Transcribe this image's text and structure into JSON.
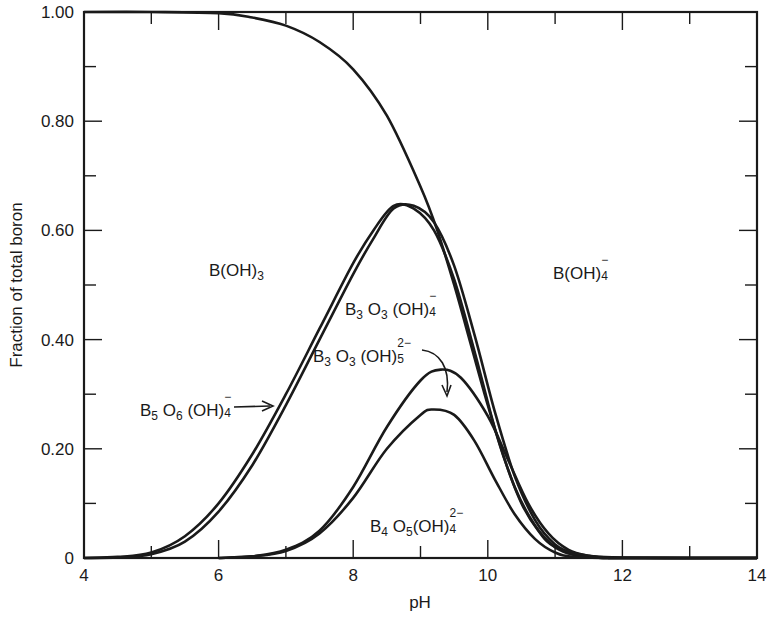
{
  "chart_data": {
    "type": "line",
    "title": "",
    "xlabel": "pH",
    "ylabel": "Fraction of total boron",
    "xlim": [
      4,
      14
    ],
    "ylim": [
      0,
      1.0
    ],
    "grid": false,
    "legend": "none (inline labels)",
    "x_ticks": [
      4,
      6,
      8,
      10,
      12,
      14
    ],
    "x_tick_labels": [
      "4",
      "6",
      "8",
      "10",
      "12",
      "14"
    ],
    "y_ticks": [
      0,
      0.2,
      0.4,
      0.6,
      0.8,
      1.0
    ],
    "y_tick_labels": [
      "0",
      "0.20",
      "0.40",
      "0.60",
      "0.80",
      "1.00"
    ],
    "series": [
      {
        "name": "B(OH)3",
        "x": [
          4,
          5,
          6,
          6.5,
          7,
          7.5,
          8,
          8.5,
          9,
          9.25,
          9.5,
          9.75,
          10,
          10.25,
          10.5,
          10.75,
          11,
          11.5,
          12,
          13,
          14
        ],
        "y": [
          1.0,
          1.0,
          0.998,
          0.99,
          0.975,
          0.945,
          0.895,
          0.81,
          0.68,
          0.6,
          0.5,
          0.39,
          0.28,
          0.18,
          0.1,
          0.05,
          0.02,
          0.004,
          0.001,
          0,
          0
        ]
      },
      {
        "name": "B3O3(OH)4- (cumulative)",
        "x": [
          4,
          4.5,
          5,
          5.5,
          6,
          6.5,
          7,
          7.5,
          8,
          8.3,
          8.6,
          8.9,
          9.2,
          9.5,
          9.8,
          10.1,
          10.4,
          10.7,
          11,
          11.3,
          11.6,
          12,
          14
        ],
        "y": [
          0,
          0.002,
          0.01,
          0.04,
          0.1,
          0.19,
          0.3,
          0.42,
          0.54,
          0.6,
          0.645,
          0.64,
          0.6,
          0.51,
          0.38,
          0.24,
          0.13,
          0.06,
          0.02,
          0.005,
          0.001,
          0,
          0
        ]
      },
      {
        "name": "B5O6(OH)4- (cumulative)",
        "x": [
          4,
          4.5,
          5,
          5.5,
          6,
          6.5,
          7,
          7.5,
          8,
          8.3,
          8.6,
          8.9,
          9.2,
          9.5,
          9.8,
          10.1,
          10.4,
          10.7,
          11,
          11.3,
          11.6,
          12,
          14
        ],
        "y": [
          0,
          0.001,
          0.007,
          0.03,
          0.085,
          0.17,
          0.28,
          0.4,
          0.52,
          0.585,
          0.64,
          0.645,
          0.615,
          0.535,
          0.41,
          0.27,
          0.15,
          0.07,
          0.025,
          0.007,
          0.001,
          0,
          0
        ]
      },
      {
        "name": "B3O3(OH)5 2- (cumulative)",
        "x": [
          6,
          6.5,
          7,
          7.5,
          8,
          8.5,
          9,
          9.3,
          9.6,
          10,
          10.3,
          10.6,
          10.9,
          11.2,
          11.5,
          11.8,
          12,
          14
        ],
        "y": [
          0,
          0.003,
          0.015,
          0.05,
          0.13,
          0.24,
          0.325,
          0.345,
          0.33,
          0.26,
          0.18,
          0.1,
          0.045,
          0.015,
          0.004,
          0.001,
          0,
          0
        ]
      },
      {
        "name": "B4O5(OH)4 2-",
        "x": [
          6,
          6.5,
          7,
          7.5,
          8,
          8.5,
          9,
          9.2,
          9.5,
          9.8,
          10.1,
          10.4,
          10.7,
          11,
          11.3,
          12,
          14
        ],
        "y": [
          0,
          0.003,
          0.013,
          0.045,
          0.11,
          0.2,
          0.262,
          0.272,
          0.262,
          0.215,
          0.145,
          0.08,
          0.035,
          0.01,
          0.002,
          0,
          0
        ]
      }
    ],
    "annotations": [
      {
        "text": "B(OH)3",
        "x": 6.1,
        "y": 0.6
      },
      {
        "text": "B3O3(OH)4-",
        "x": 8.0,
        "y": 0.45
      },
      {
        "text": "B3O3(OH)5 2-",
        "x": 7.7,
        "y": 0.37,
        "arrow_to": [
          9.5,
          0.29
        ]
      },
      {
        "text": "B5O6(OH)4-",
        "x": 4.9,
        "y": 0.27,
        "arrow_to": [
          6.9,
          0.28
        ]
      },
      {
        "text": "B4O5(OH)4 2-",
        "x": 8.2,
        "y": 0.1
      },
      {
        "text": "B(OH)4-",
        "x": 11.0,
        "y": 0.6
      }
    ]
  },
  "labels": {
    "b_oh3": {
      "base": "B(OH)",
      "sub": "3"
    },
    "b_oh4": {
      "base": "B(OH)",
      "sub": "4",
      "sup": "−"
    },
    "b3o3oh4": {
      "b": "B",
      "b_sub": "3",
      "o": " O",
      "o_sub": "3",
      "oh": " (OH)",
      "sub": "4",
      "sup": "−"
    },
    "b3o3oh5": {
      "b": "B",
      "b_sub": "3",
      "o": " O",
      "o_sub": "3",
      "oh": " (OH)",
      "sub": "5",
      "sup": "2−"
    },
    "b5o6oh4": {
      "b": "B",
      "b_sub": "5",
      "o": " O",
      "o_sub": "6",
      "oh": " (OH)",
      "sub": "4",
      "sup": "−"
    },
    "b4o5oh4": {
      "b": "B",
      "b_sub": "4",
      "o": " O",
      "o_sub": "5",
      "oh": "(OH)",
      "sub": "4",
      "sup": "2−"
    }
  },
  "style": {
    "ink": "#1a1a1a",
    "background": "#ffffff"
  }
}
